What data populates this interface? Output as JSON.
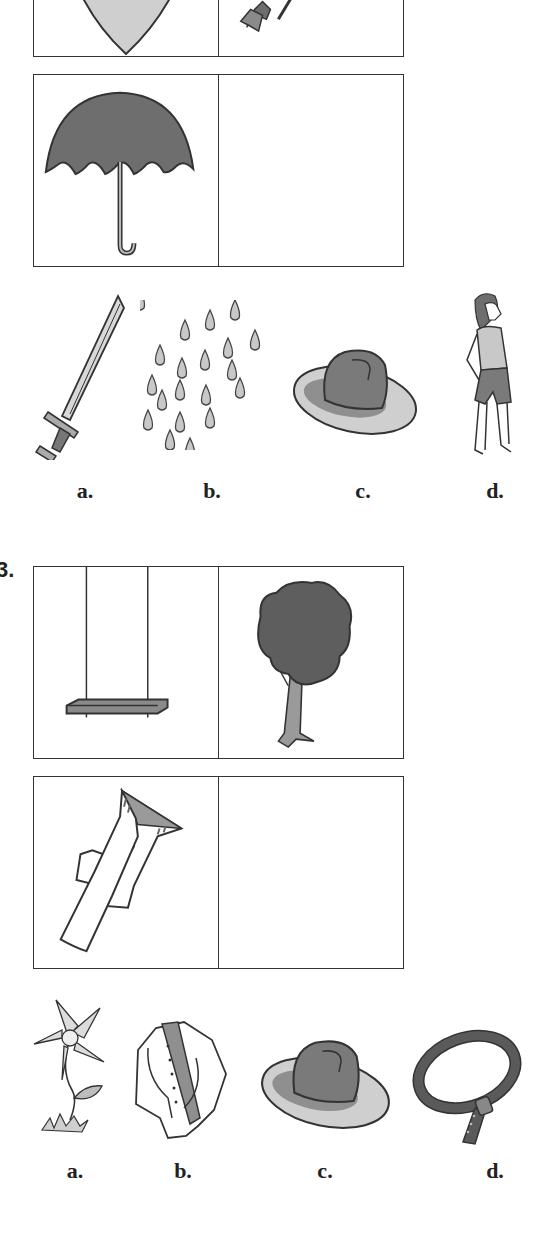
{
  "question_2": {
    "analogy": {
      "top_left": "shield",
      "top_right": "arrow",
      "bottom_left": "umbrella",
      "bottom_right": ""
    },
    "choices": [
      {
        "label": "a.",
        "icon": "sword"
      },
      {
        "label": "b.",
        "icon": "raindrops"
      },
      {
        "label": "c.",
        "icon": "hat"
      },
      {
        "label": "d.",
        "icon": "girl"
      }
    ]
  },
  "question_3": {
    "number": "3.",
    "analogy": {
      "top_left": "swing",
      "top_right": "tree",
      "bottom_left": "pants",
      "bottom_right": ""
    },
    "choices": [
      {
        "label": "a.",
        "icon": "flower"
      },
      {
        "label": "b.",
        "icon": "jacket"
      },
      {
        "label": "c.",
        "icon": "hat"
      },
      {
        "label": "d.",
        "icon": "belt"
      }
    ]
  },
  "colors": {
    "line": "#333333",
    "dark_fill": "#6e6e6e",
    "mid_fill": "#9a9a9a",
    "light_fill": "#cfcfcf"
  }
}
